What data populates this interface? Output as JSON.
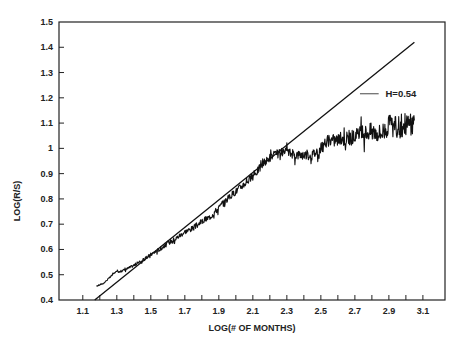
{
  "chart_data": {
    "type": "line",
    "title": "",
    "xlabel": "LOG(# OF MONTHS)",
    "ylabel": "LOG(R/S)",
    "xlim": [
      0.96,
      3.23
    ],
    "ylim": [
      0.4,
      1.5
    ],
    "grid": false,
    "x_tick_labels": [
      "1.1",
      "1.3",
      "1.5",
      "1.7",
      "1.9",
      "2.1",
      "2.3",
      "2.5",
      "2.7",
      "2.9",
      "3.1"
    ],
    "x_tick_values": [
      1.1,
      1.3,
      1.5,
      1.7,
      1.9,
      2.1,
      2.3,
      2.5,
      2.7,
      2.9,
      3.1
    ],
    "x_minor_ticks": [
      1.0,
      1.2,
      1.4,
      1.6,
      1.8,
      2.0,
      2.2,
      2.4,
      2.6,
      2.8,
      3.0
    ],
    "y_tick_labels": [
      "0.4",
      "0.5",
      "0.6",
      "0.7",
      "0.8",
      "0.9",
      "1",
      "1.1",
      "1.2",
      "1.3",
      "1.4",
      "1.5"
    ],
    "y_tick_values": [
      0.4,
      0.5,
      0.6,
      0.7,
      0.8,
      0.9,
      1.0,
      1.1,
      1.2,
      1.3,
      1.4,
      1.5
    ],
    "annotations": [
      {
        "text": "H=0.54",
        "x": 2.88,
        "y": 1.216,
        "leader_from_x": 2.73,
        "leader_to_x": 2.84
      }
    ],
    "series": [
      {
        "name": "H=0.54 fitted line",
        "style": "straight",
        "x": [
          1.17,
          3.05
        ],
        "y": [
          0.4,
          1.42
        ]
      },
      {
        "name": "Empirical LOG(R/S)",
        "style": "noisy",
        "x": [
          1.18,
          1.22,
          1.26,
          1.29,
          1.33,
          1.38,
          1.42,
          1.46,
          1.5,
          1.55,
          1.6,
          1.65,
          1.7,
          1.75,
          1.8,
          1.85,
          1.9,
          1.95,
          2.0,
          2.05,
          2.1,
          2.15,
          2.2,
          2.25,
          2.3,
          2.35,
          2.4,
          2.45,
          2.5,
          2.55,
          2.6,
          2.65,
          2.7,
          2.75,
          2.8,
          2.85,
          2.9,
          2.95,
          3.0,
          3.03,
          3.05
        ],
        "y": [
          0.455,
          0.465,
          0.49,
          0.51,
          0.515,
          0.53,
          0.545,
          0.56,
          0.58,
          0.6,
          0.625,
          0.645,
          0.67,
          0.685,
          0.71,
          0.73,
          0.765,
          0.8,
          0.83,
          0.86,
          0.89,
          0.93,
          0.965,
          0.98,
          0.985,
          0.975,
          0.975,
          0.975,
          1.0,
          1.03,
          1.035,
          1.04,
          1.045,
          1.06,
          1.07,
          1.06,
          1.09,
          1.08,
          1.1,
          1.09,
          1.11
        ],
        "noise_amplitude": [
          0.002,
          0.002,
          0.003,
          0.003,
          0.004,
          0.005,
          0.006,
          0.006,
          0.007,
          0.008,
          0.009,
          0.01,
          0.01,
          0.011,
          0.012,
          0.012,
          0.013,
          0.013,
          0.014,
          0.015,
          0.016,
          0.016,
          0.017,
          0.018,
          0.018,
          0.019,
          0.02,
          0.021,
          0.023,
          0.025,
          0.027,
          0.03,
          0.032,
          0.034,
          0.036,
          0.04,
          0.043,
          0.046,
          0.048,
          0.05,
          0.05
        ]
      }
    ]
  },
  "plot_area": {
    "left_px": 59,
    "right_px": 445,
    "top_px": 22,
    "bottom_px": 300
  }
}
